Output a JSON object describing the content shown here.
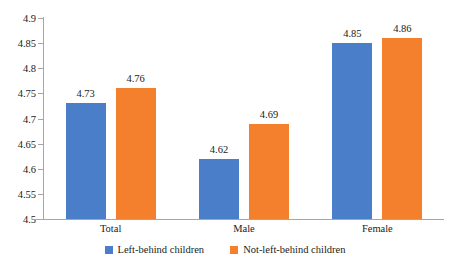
{
  "chart_data": {
    "type": "bar",
    "title": "",
    "subtitle": "",
    "xlabel": "",
    "ylabel": "",
    "categories": [
      "Total",
      "Male",
      "Female"
    ],
    "series": [
      {
        "name": "Left-behind children",
        "color": "#4a7ec8",
        "values": [
          4.73,
          4.62,
          4.85
        ]
      },
      {
        "name": "Not-left-behind children",
        "color": "#f4802d",
        "values": [
          4.76,
          4.69,
          4.86
        ]
      }
    ],
    "ylim": [
      4.5,
      4.9
    ],
    "ytick_labels": [
      "4.9",
      "4.85",
      "4.8",
      "4.75",
      "4.7",
      "4.65",
      "4.6",
      "4.55",
      "4.5"
    ],
    "ytick_values": [
      4.9,
      4.85,
      4.8,
      4.75,
      4.7,
      4.65,
      4.6,
      4.55,
      4.5
    ],
    "data_labels": [
      [
        "4.73",
        "4.76"
      ],
      [
        "4.62",
        "4.69"
      ],
      [
        "4.85",
        "4.86"
      ]
    ],
    "grid": false,
    "legend_position": "bottom"
  },
  "axis": {
    "line_color": "#a6a6a6"
  }
}
